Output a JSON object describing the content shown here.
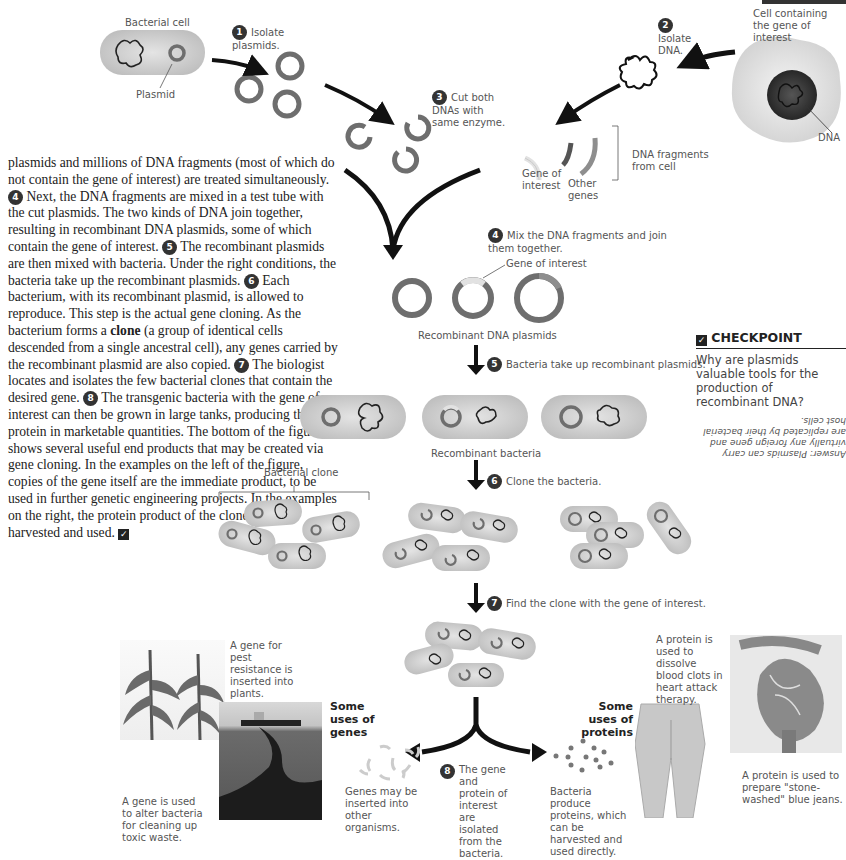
{
  "figure": {
    "top_bar_color": "#333333",
    "bacterial_cell_label": "Bacterial cell",
    "plasmid_label": "Plasmid",
    "cell_gene_label": "Cell containing the gene of interest",
    "dna_label": "DNA",
    "steps": [
      {
        "num": "1",
        "text": "Isolate plasmids."
      },
      {
        "num": "2",
        "text": "Isolate DNA."
      },
      {
        "num": "3",
        "text": "Cut both DNAs with same enzyme."
      },
      {
        "num": "4",
        "text": "Mix the DNA fragments and join them together."
      },
      {
        "num": "5",
        "text": "Bacteria take up recombinant plasmids."
      },
      {
        "num": "6",
        "text": "Clone the bacteria."
      },
      {
        "num": "7",
        "text": "Find the clone with the gene of interest."
      },
      {
        "num": "8",
        "text": "The gene and protein of interest are isolated from the bacteria."
      }
    ],
    "gene_of_interest_label": "Gene of interest",
    "gene_of_interest_label_2": "Gene of interest",
    "other_genes_label": "Other genes",
    "dna_fragments_label": "DNA fragments from cell",
    "recombinant_plasmids_label": "Recombinant DNA plasmids",
    "recombinant_bacteria_label": "Recombinant bacteria",
    "bacterial_clone_label": "Bacterial clone",
    "uses_genes_heading": "Some uses of genes",
    "uses_proteins_heading": "Some uses of proteins",
    "pest_resistance_caption": "A gene for pest resistance is inserted into plants.",
    "toxic_waste_caption": "A gene is used to alter bacteria for cleaning up toxic waste.",
    "genes_inserted_caption": "Genes may be inserted into other organisms.",
    "bacteria_produce_caption": "Bacteria produce proteins, which can be harvested and used directly.",
    "blood_clots_caption": "A protein is used to dissolve blood clots in heart attack therapy.",
    "jeans_caption": "A protein is used to prepare \"stone-washed\" blue jeans."
  },
  "text": {
    "p1_a": "plasmids and millions of DNA fragments (most of which do not contain the gene of interest) are treated simultaneously. ",
    "n4": "4",
    "p1_b": " Next, the DNA fragments are mixed in a test tube with the cut plasmids. The two kinds of DNA join together, resulting in recombinant DNA plasmids, some of which contain the gene of interest. ",
    "n5": "5",
    "p1_c": " The recombinant plasmids are then mixed with bacteria. Under the right conditions, the bacteria take up the recombinant plasmids. ",
    "n6": "6",
    "p1_d": " Each bacterium, with its recombinant plasmid, is allowed to reproduce. This step is the actual gene cloning. As the bacterium forms a ",
    "clone_term": "clone",
    "p1_e": " (a group of identical cells descended from a single ancestral cell), any genes carried by the recombinant plasmid are also copied. ",
    "n7": "7",
    "p1_f": " The biologist locates and isolates the few bacterial clones that contain the desired gene. ",
    "n8": "8",
    "p1_g": " The transgenic bacteria with the gene of interest can then be grown in large tanks, producing the protein in marketable quantities. The bottom of the figure shows several useful end products that may be created via gene cloning. In the examples on the left of the figure, copies of the gene itself are the immediate product, to be used in further genetic engineering projects. In the examples on the right, the protein product of the cloned gene is harvested and used. ",
    "check_mark": "✓"
  },
  "checkpoint": {
    "heading": "CHECKPOINT",
    "icon": "checkbox-icon",
    "question": "Why are plasmids valuable tools for the production of recombinant DNA?",
    "answer": "Answer: Plasmids can carry virtually any foreign gene and are replicated by their bacterial host cells."
  },
  "colors": {
    "plasmid_ring": "#6e6e6e",
    "gene_segment": "#dcdcdc",
    "cell_fill": "#cfcfcf",
    "arrow": "#111111"
  }
}
